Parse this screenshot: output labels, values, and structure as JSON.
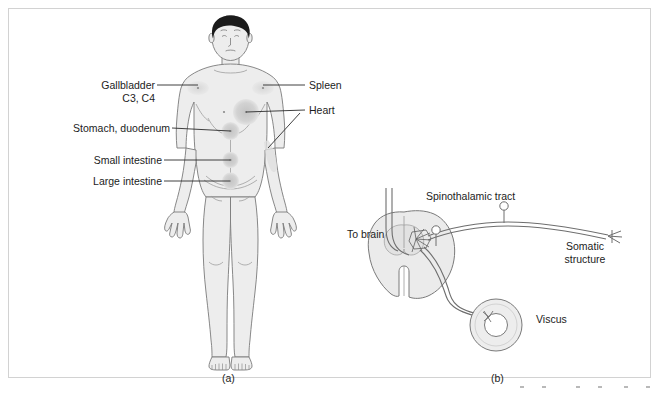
{
  "figure": {
    "panels": [
      {
        "caption": "(a)",
        "title_hidden": "",
        "labels_left": [
          {
            "name": "gallbladder",
            "line1": "Gallbladder",
            "line2": "C3, C4"
          },
          {
            "name": "stomach-duodenum",
            "line1": "Stomach, duodenum",
            "line2": ""
          },
          {
            "name": "small-intestine",
            "line1": "Small intestine",
            "line2": ""
          },
          {
            "name": "large-intestine",
            "line1": "Large intestine",
            "line2": ""
          }
        ],
        "labels_right": [
          {
            "name": "spleen",
            "line1": "Spleen"
          },
          {
            "name": "heart",
            "line1": "Heart"
          }
        ]
      },
      {
        "caption": "(b)",
        "labels": [
          {
            "name": "to-brain",
            "line1": "To brain",
            "line2": ""
          },
          {
            "name": "spinothalamic-tract",
            "line1": "Spinothalamic tract",
            "line2": ""
          },
          {
            "name": "somatic-structure",
            "line1": "Somatic",
            "line2": "structure"
          },
          {
            "name": "viscus",
            "line1": "Viscus",
            "line2": ""
          }
        ]
      }
    ]
  },
  "colors": {
    "stroke": "#6b6b6b",
    "body_fill": "#ededed",
    "patch_light": "#dcdcdc",
    "patch_dark": "#c9c9c9",
    "hair": "#1b1b1b",
    "leader": "#2b2b2b",
    "border": "#d2d2d2",
    "cord_fill": "#ebebeb",
    "gray_matter": "#e2e2e2"
  }
}
